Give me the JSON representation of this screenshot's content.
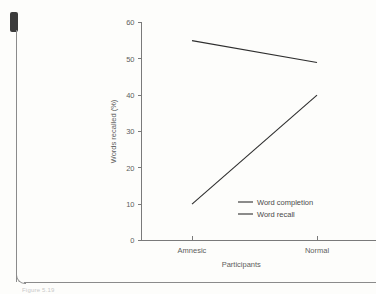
{
  "page": {
    "caption": "Figure 5.19",
    "marker_icon": "page-marker-icon"
  },
  "chart_data": {
    "type": "line",
    "title": "",
    "xlabel": "Participants",
    "ylabel": "Words recalled (%)",
    "categories": [
      "Amnesic",
      "Normal"
    ],
    "ylim": [
      0,
      60
    ],
    "yticks": [
      0,
      10,
      20,
      30,
      40,
      50,
      60
    ],
    "ytick_labels": [
      "0",
      "10",
      "20",
      "30",
      "40",
      "50",
      "60"
    ],
    "grid": false,
    "legend_position": "inside lower-right",
    "series": [
      {
        "name": "Word completion",
        "values": [
          55,
          49
        ]
      },
      {
        "name": "Word recall",
        "values": [
          10,
          40
        ]
      }
    ]
  }
}
